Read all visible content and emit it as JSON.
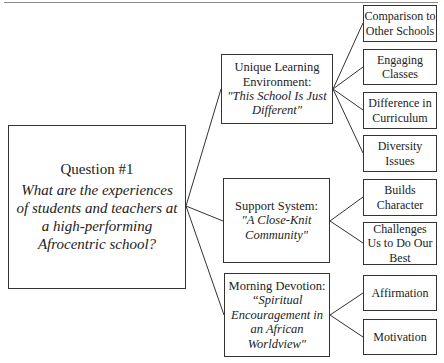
{
  "root": {
    "title": "Question #1",
    "question": "What are the experiences of students and teachers at a high-performing Afrocentric school?"
  },
  "themes": [
    {
      "title": "Unique Learning Environment:",
      "quote": "\"This School Is Just Different\"",
      "subthemes": [
        "Comparison to Other Schools",
        "Engaging Classes",
        "Difference in Curriculum",
        "Diversity Issues"
      ]
    },
    {
      "title": "Support System:",
      "quote": "\"A Close-Knit Community\"",
      "subthemes": [
        "Builds Character",
        "Challenges Us to Do Our Best"
      ]
    },
    {
      "title": "Morning Devotion:",
      "quote": "“Spiritual Encouragement in an African Worldview\"",
      "subthemes": [
        "Affirmation",
        "Motivation"
      ]
    }
  ]
}
